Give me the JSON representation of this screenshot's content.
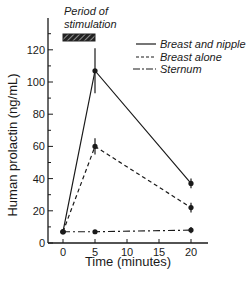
{
  "chart_data": {
    "type": "line",
    "title": "",
    "xlabel": "Time (minutes)",
    "ylabel": "Human prolactin (ng/mL)",
    "x": [
      0,
      5,
      20
    ],
    "xticks": [
      "0",
      "5",
      "10",
      "15",
      "20"
    ],
    "yticks": [
      "0",
      "20",
      "40",
      "60",
      "80",
      "100",
      "120"
    ],
    "xlim": [
      -1,
      22
    ],
    "ylim": [
      0,
      135
    ],
    "grid": false,
    "legend_position": "upper right",
    "annotation": {
      "text_line1": "Period of",
      "text_line2": "stimulation",
      "x_range": [
        0,
        5
      ]
    },
    "series": [
      {
        "name": "Breast and nipple",
        "style": "solid",
        "values": [
          7,
          107,
          37
        ],
        "error": [
          1,
          14,
          3
        ]
      },
      {
        "name": "Breast alone",
        "style": "dashed",
        "values": [
          7,
          60,
          22
        ],
        "error": [
          1,
          5,
          3
        ]
      },
      {
        "name": "Sternum",
        "style": "dash-dot",
        "values": [
          7,
          7,
          8
        ],
        "error": [
          1,
          1,
          2
        ]
      }
    ]
  },
  "labels": {
    "xlabel": "Time (minutes)",
    "ylabel": "Human prolactin (ng/mL)",
    "stim1": "Period of",
    "stim2": "stimulation",
    "legend": [
      "Breast and nipple",
      "Breast alone",
      "Sternum"
    ]
  }
}
